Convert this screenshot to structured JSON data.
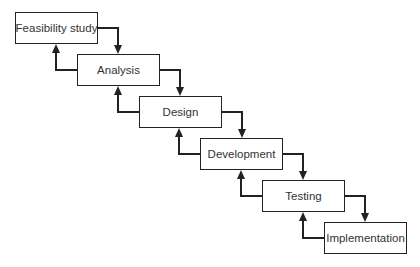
{
  "diagram": {
    "type": "waterfall-model",
    "stages": [
      {
        "label": "Feasibility study",
        "x": 15,
        "y": 12,
        "w": 83,
        "h": 32
      },
      {
        "label": "Analysis",
        "x": 77,
        "y": 54,
        "w": 83,
        "h": 32
      },
      {
        "label": "Design",
        "x": 139,
        "y": 96,
        "w": 83,
        "h": 32
      },
      {
        "label": "Development",
        "x": 200,
        "y": 138,
        "w": 83,
        "h": 32
      },
      {
        "label": "Testing",
        "x": 262,
        "y": 180,
        "w": 83,
        "h": 32
      },
      {
        "label": "Implementation",
        "x": 324,
        "y": 222,
        "w": 83,
        "h": 32
      }
    ],
    "colors": {
      "line": "#222222",
      "text": "#333333",
      "background": "#ffffff"
    }
  }
}
